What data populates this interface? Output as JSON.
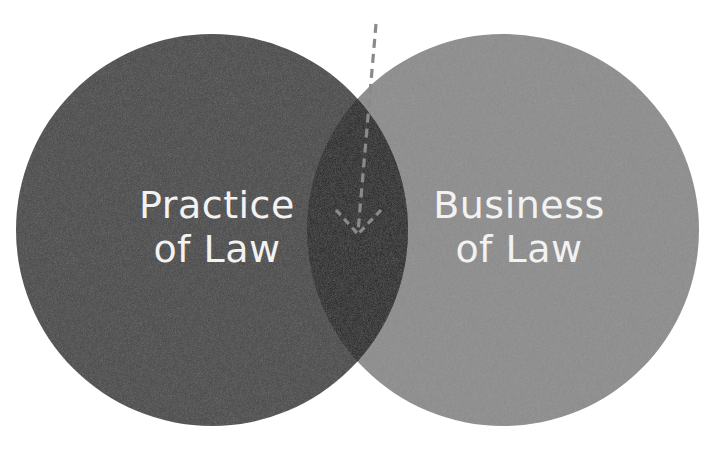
{
  "diagram": {
    "type": "venn",
    "sets": [
      {
        "id": "practice",
        "line1": "Practice",
        "line2": "of Law",
        "color": "#454545"
      },
      {
        "id": "business",
        "line1": "Business",
        "line2": "of Law",
        "color": "#8b8b8b"
      }
    ],
    "intersection": {
      "color": "#1f1f1f",
      "marker": "dashed-arrow-pointing-down"
    },
    "arrow_color": "#8a8a8a",
    "background": "#ffffff"
  }
}
